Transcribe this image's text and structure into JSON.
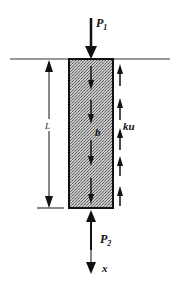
{
  "diagram": {
    "labels": {
      "top_load": "P",
      "top_load_sub": "1",
      "bottom_load": "P",
      "bottom_load_sub": "2",
      "length": "L",
      "body_force": "b",
      "skin_friction": "ku",
      "axis": "x"
    },
    "colors": {
      "stroke": "#111111",
      "pile_fill": "#9a9a9a",
      "background": "#ffffff"
    },
    "elements": {
      "ground_line": "ground surface line",
      "pile": "pile rectangle (hatched/stippled)",
      "length_dimension": "dimension arrow spanning pile length",
      "body_force_arrows_count": 4,
      "skin_friction_arrows_count": 5
    }
  }
}
